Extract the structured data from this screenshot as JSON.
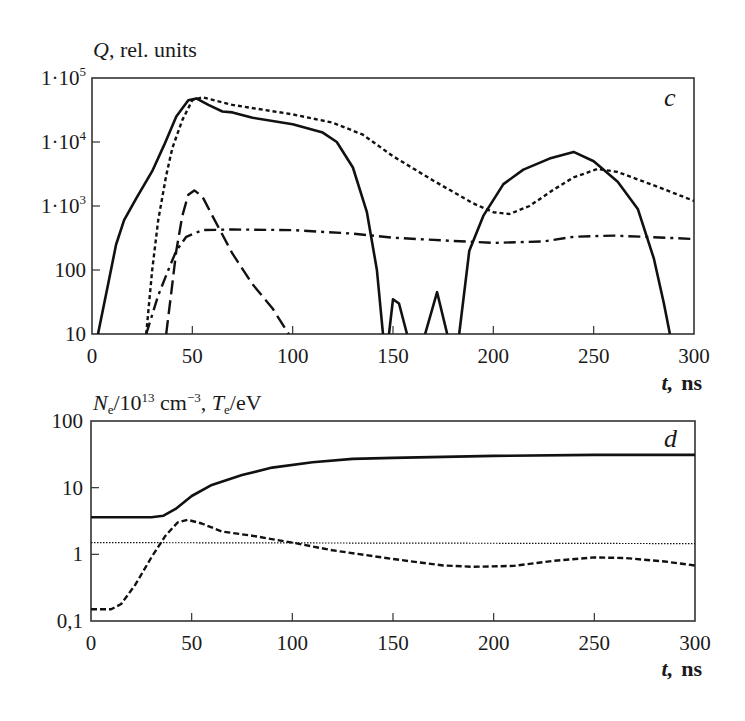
{
  "chart_data": [
    {
      "panel": "c",
      "type": "line",
      "title": "",
      "ylabel": "Q, rel. units",
      "xlabel": "t, ns",
      "yscale": "log",
      "ylim": [
        10,
        100000
      ],
      "xlim": [
        0,
        300
      ],
      "grid": false,
      "x_ticks": [
        "0",
        "50",
        "100",
        "150",
        "200",
        "250",
        "300"
      ],
      "y_ticks": [
        "10",
        "100",
        "1·10^3",
        "1·10^4",
        "1·10^5"
      ],
      "series": [
        {
          "name": "solid",
          "style": "solid",
          "points": [
            [
              3,
              10
            ],
            [
              8,
              60
            ],
            [
              12,
              250
            ],
            [
              16,
              600
            ],
            [
              22,
              1300
            ],
            [
              30,
              3500
            ],
            [
              36,
              9000
            ],
            [
              42,
              25000
            ],
            [
              48,
              45000
            ],
            [
              52,
              48000
            ],
            [
              58,
              38000
            ],
            [
              65,
              30000
            ],
            [
              70,
              29000
            ],
            [
              80,
              24000
            ],
            [
              100,
              19000
            ],
            [
              115,
              14000
            ],
            [
              122,
              10000
            ],
            [
              130,
              4000
            ],
            [
              137,
              800
            ],
            [
              142,
              100
            ],
            [
              145,
              10
            ]
          ],
          "extra_segments": [
            [
              [
                148,
                10
              ],
              [
                150,
                35
              ],
              [
                153,
                30
              ],
              [
                157,
                10
              ]
            ],
            [
              [
                166,
                10
              ],
              [
                172,
                45
              ],
              [
                177,
                10
              ]
            ],
            [
              [
                183,
                10
              ],
              [
                188,
                200
              ],
              [
                195,
                700
              ],
              [
                205,
                2200
              ],
              [
                215,
                3700
              ],
              [
                228,
                5500
              ],
              [
                240,
                7000
              ],
              [
                250,
                5000
              ],
              [
                262,
                2400
              ],
              [
                272,
                900
              ],
              [
                280,
                150
              ],
              [
                285,
                30
              ],
              [
                288,
                10
              ]
            ]
          ]
        },
        {
          "name": "short-dashed",
          "style": "dotted-dashed-short",
          "points": [
            [
              27,
              10
            ],
            [
              30,
              100
            ],
            [
              33,
              600
            ],
            [
              37,
              3000
            ],
            [
              40,
              8000
            ],
            [
              45,
              22000
            ],
            [
              50,
              45000
            ],
            [
              55,
              50000
            ],
            [
              70,
              38000
            ],
            [
              100,
              27000
            ],
            [
              120,
              20000
            ],
            [
              135,
              13000
            ],
            [
              150,
              6000
            ],
            [
              170,
              2500
            ],
            [
              190,
              1100
            ],
            [
              200,
              800
            ],
            [
              208,
              750
            ],
            [
              218,
              1000
            ],
            [
              230,
              1800
            ],
            [
              240,
              2800
            ],
            [
              252,
              3800
            ],
            [
              262,
              3400
            ],
            [
              280,
              2100
            ],
            [
              300,
              1200
            ]
          ]
        },
        {
          "name": "long-dashed",
          "style": "long-dash",
          "points": [
            [
              37,
              10
            ],
            [
              40,
              60
            ],
            [
              42,
              200
            ],
            [
              45,
              700
            ],
            [
              48,
              1500
            ],
            [
              51,
              1750
            ],
            [
              55,
              1400
            ],
            [
              60,
              700
            ],
            [
              70,
              180
            ],
            [
              80,
              60
            ],
            [
              90,
              25
            ],
            [
              98,
              10
            ]
          ]
        },
        {
          "name": "dash-dot",
          "style": "dash-dot",
          "points": [
            [
              27,
              10
            ],
            [
              33,
              40
            ],
            [
              38,
              100
            ],
            [
              42,
              200
            ],
            [
              47,
              330
            ],
            [
              55,
              420
            ],
            [
              70,
              430
            ],
            [
              100,
              420
            ],
            [
              130,
              370
            ],
            [
              150,
              320
            ],
            [
              175,
              290
            ],
            [
              200,
              265
            ],
            [
              225,
              280
            ],
            [
              240,
              330
            ],
            [
              260,
              345
            ],
            [
              280,
              325
            ],
            [
              300,
              305
            ]
          ]
        }
      ]
    },
    {
      "panel": "d",
      "type": "line",
      "title": "",
      "ylabel": "N_e/10^13 cm^-3, T_e/eV",
      "xlabel": "t, ns",
      "yscale": "log",
      "ylim": [
        0.1,
        100
      ],
      "xlim": [
        0,
        300
      ],
      "grid": false,
      "x_ticks": [
        "0",
        "50",
        "100",
        "150",
        "200",
        "250",
        "300"
      ],
      "y_ticks": [
        "0,1",
        "1",
        "10",
        "100"
      ],
      "series": [
        {
          "name": "solid",
          "style": "solid",
          "points": [
            [
              0,
              3.6
            ],
            [
              30,
              3.6
            ],
            [
              36,
              3.8
            ],
            [
              42,
              4.8
            ],
            [
              50,
              7.5
            ],
            [
              60,
              11
            ],
            [
              75,
              15.5
            ],
            [
              90,
              20
            ],
            [
              110,
              24
            ],
            [
              130,
              27
            ],
            [
              150,
              28
            ],
            [
              200,
              30
            ],
            [
              250,
              31
            ],
            [
              300,
              31
            ]
          ]
        },
        {
          "name": "dashed",
          "style": "dashed",
          "points": [
            [
              0,
              0.15
            ],
            [
              10,
              0.15
            ],
            [
              15,
              0.18
            ],
            [
              22,
              0.35
            ],
            [
              30,
              0.9
            ],
            [
              37,
              1.9
            ],
            [
              43,
              3.0
            ],
            [
              48,
              3.3
            ],
            [
              55,
              2.9
            ],
            [
              65,
              2.2
            ],
            [
              80,
              1.9
            ],
            [
              100,
              1.5
            ],
            [
              120,
              1.15
            ],
            [
              150,
              0.85
            ],
            [
              175,
              0.68
            ],
            [
              190,
              0.65
            ],
            [
              210,
              0.67
            ],
            [
              230,
              0.8
            ],
            [
              250,
              0.9
            ],
            [
              265,
              0.88
            ],
            [
              285,
              0.78
            ],
            [
              300,
              0.68
            ]
          ]
        },
        {
          "name": "dotted-reference",
          "style": "dotted",
          "points": [
            [
              0,
              1.5
            ],
            [
              300,
              1.45
            ]
          ]
        }
      ]
    }
  ],
  "panels": {
    "top": {
      "ylabel_main": "Q",
      "ylabel_rest": ", rel. units",
      "letter": "c",
      "x_ticks": [
        "0",
        "50",
        "100",
        "150",
        "200",
        "250",
        "300"
      ],
      "y_ticks": [
        {
          "mant": "1·10",
          "exp": "5"
        },
        {
          "mant": "1·10",
          "exp": "4"
        },
        {
          "mant": "1·10",
          "exp": "3"
        },
        {
          "mant": "100",
          "exp": ""
        },
        {
          "mant": "10",
          "exp": ""
        }
      ],
      "xlabel_var": "t,",
      "xlabel_unit": "ns"
    },
    "bottom": {
      "ylabel_ne": "N",
      "ylabel_ne_sub": "e",
      "ylabel_mid": "/10",
      "ylabel_exp": "13",
      "ylabel_cm": " cm",
      "ylabel_cm_exp": "−3",
      "ylabel_comma": ", ",
      "ylabel_te": "T",
      "ylabel_te_sub": "e",
      "ylabel_ev": "/eV",
      "letter": "d",
      "x_ticks": [
        "0",
        "50",
        "100",
        "150",
        "200",
        "250",
        "300"
      ],
      "y_ticks": [
        "100",
        "10",
        "1",
        "0,1"
      ],
      "xlabel_var": "t,",
      "xlabel_unit": "ns"
    }
  }
}
